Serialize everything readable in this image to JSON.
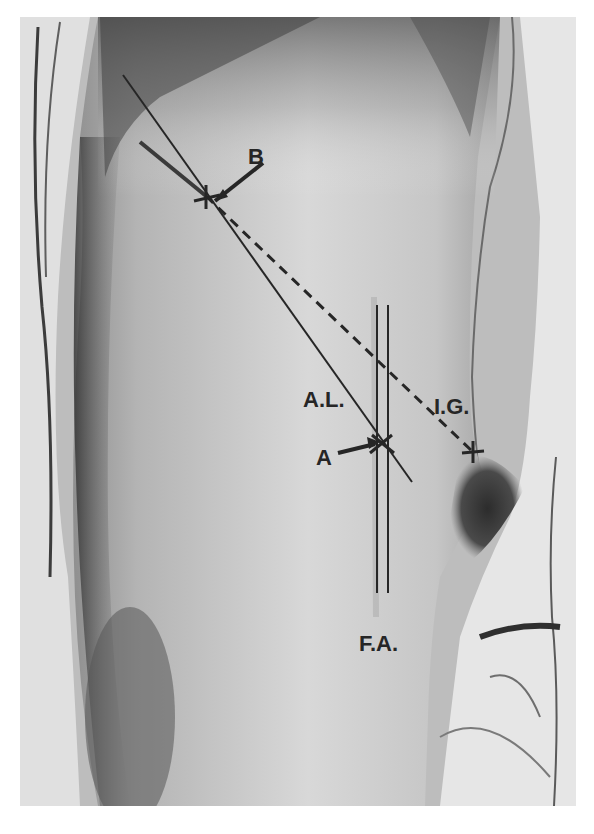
{
  "figure": {
    "labels": {
      "point_b": "B",
      "point_a": "A",
      "line_al": "A.L.",
      "line_ig": "I.G.",
      "line_fa": "F.A."
    },
    "caption_visible": "(caption text cut off at bottom edge)"
  },
  "colors": {
    "background": "#ffffff",
    "ink": "#262626",
    "skin_light": "#d6d6d6",
    "skin_mid": "#a9a9a9",
    "shadow": "#3a3a3a",
    "cloth": "#e2e2e2"
  }
}
